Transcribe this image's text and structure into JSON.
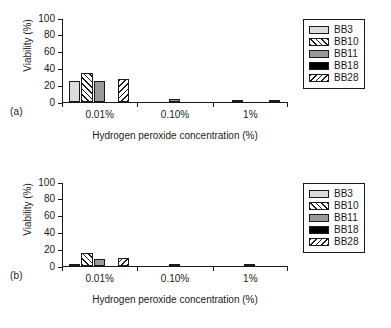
{
  "figure": {
    "panels": [
      {
        "letter": "(a)"
      },
      {
        "letter": "(b)"
      }
    ]
  },
  "axes": {
    "ylabel": "Viability (%)",
    "xlabel": "Hydrogen peroxide concentration (%)",
    "yticks": [
      "0",
      "20",
      "40",
      "60",
      "80",
      "100"
    ],
    "xticks": [
      "0.01%",
      "0.10%",
      "1%"
    ]
  },
  "legend": {
    "entries": [
      {
        "label": "BB3",
        "key": "BB3",
        "fill": "#dcdcdc",
        "pattern": "solid"
      },
      {
        "label": "BB10",
        "key": "BB10",
        "fill": "#ffffff",
        "pattern": "forward-hatch"
      },
      {
        "label": "BB11",
        "key": "BB11",
        "fill": "#9a9a9a",
        "pattern": "solid"
      },
      {
        "label": "BB18",
        "key": "BB18",
        "fill": "#000000",
        "pattern": "solid"
      },
      {
        "label": "BB28",
        "key": "BB28",
        "fill": "#ffffff",
        "pattern": "backward-hatch"
      }
    ]
  },
  "chart_data": [
    {
      "type": "bar",
      "panel": "(a)",
      "title": "",
      "xlabel": "Hydrogen peroxide concentration (%)",
      "ylabel": "Viability (%)",
      "ylim": [
        0,
        100
      ],
      "yticks": [
        0,
        20,
        40,
        60,
        80,
        100
      ],
      "grid": false,
      "legend_position": "right-outside",
      "categories": [
        "0.01%",
        "0.10%",
        "1%"
      ],
      "series": [
        {
          "name": "BB3",
          "values": [
            25,
            0,
            0
          ]
        },
        {
          "name": "BB10",
          "values": [
            35,
            0,
            2
          ]
        },
        {
          "name": "BB11",
          "values": [
            25,
            3,
            0
          ]
        },
        {
          "name": "BB18",
          "values": [
            0,
            0,
            0
          ]
        },
        {
          "name": "BB28",
          "values": [
            27,
            0,
            2
          ]
        }
      ]
    },
    {
      "type": "bar",
      "panel": "(b)",
      "title": "",
      "xlabel": "Hydrogen peroxide concentration (%)",
      "ylabel": "Viability (%)",
      "ylim": [
        0,
        100
      ],
      "yticks": [
        0,
        20,
        40,
        60,
        80,
        100
      ],
      "grid": false,
      "legend_position": "right-outside",
      "categories": [
        "0.01%",
        "0.10%",
        "1%"
      ],
      "series": [
        {
          "name": "BB3",
          "values": [
            2,
            0,
            0
          ]
        },
        {
          "name": "BB10",
          "values": [
            15,
            0,
            0
          ]
        },
        {
          "name": "BB11",
          "values": [
            8,
            2,
            2
          ]
        },
        {
          "name": "BB18",
          "values": [
            0,
            0,
            0
          ]
        },
        {
          "name": "BB28",
          "values": [
            9,
            0,
            0
          ]
        }
      ]
    }
  ]
}
